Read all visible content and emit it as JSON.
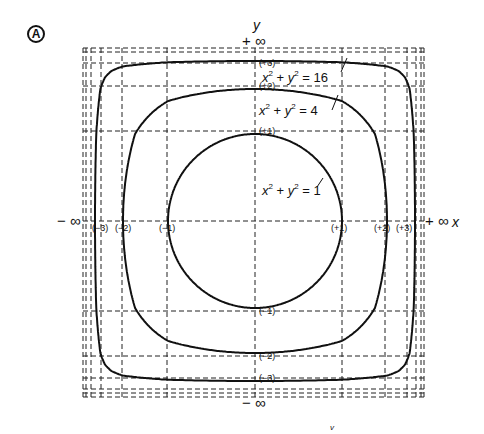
{
  "figure": {
    "panel_label": "A",
    "x_axis_label": "x",
    "y_axis_label": "y",
    "pos_inf_x": "+ ∞",
    "neg_inf_x": "− ∞",
    "pos_inf_y": "+ ∞",
    "neg_inf_y": "− ∞",
    "stray_mark": "v"
  },
  "ticks": {
    "x": [
      {
        "value": -3,
        "label": "(−3)",
        "px": 101
      },
      {
        "value": -2,
        "label": "(−2)",
        "px": 122
      },
      {
        "value": -1,
        "label": "(−1)",
        "px": 167
      },
      {
        "value": 1,
        "label": "(+1)",
        "px": 342
      },
      {
        "value": 2,
        "label": "(+2)",
        "px": 385
      },
      {
        "value": 3,
        "label": "(+3)",
        "px": 407
      }
    ],
    "y": [
      {
        "value": 3,
        "label": "(+3)",
        "px": 63
      },
      {
        "value": 2,
        "label": "(+2)",
        "px": 86
      },
      {
        "value": 1,
        "label": "(+1)",
        "px": 131
      },
      {
        "value": -1,
        "label": "(−1)",
        "px": 311
      },
      {
        "value": -2,
        "label": "(−2)",
        "px": 356
      },
      {
        "value": -3,
        "label": "(−3)",
        "px": 378
      }
    ]
  },
  "curves": [
    {
      "equation": "x² + y² = 1",
      "lhs_x": "x",
      "lhs_y": "y",
      "exp": "2",
      "rhs": "1",
      "radius": 1
    },
    {
      "equation": "x² + y² = 4",
      "lhs_x": "x",
      "lhs_y": "y",
      "exp": "2",
      "rhs": "4",
      "radius": 2
    },
    {
      "equation": "x² + y² = 16",
      "lhs_x": "x",
      "lhs_y": "y",
      "exp": "2",
      "rhs": "16",
      "radius": 4
    }
  ],
  "chart_data": {
    "type": "line",
    "xlabel": "x",
    "ylabel": "y",
    "x_range": [
      "−∞",
      "+∞"
    ],
    "y_range": [
      "−∞",
      "+∞"
    ],
    "grid": "dashed, at integer values and approaching ±∞",
    "tick_labels_x": [
      "(−3)",
      "(−2)",
      "(−1)",
      "(+1)",
      "(+2)",
      "(+3)"
    ],
    "tick_labels_y": [
      "(+3)",
      "(+2)",
      "(+1)",
      "(−1)",
      "(−2)",
      "(−3)"
    ],
    "series": [
      {
        "name": "x² + y² = 1",
        "radius": 1
      },
      {
        "name": "x² + y² = 4",
        "radius": 2
      },
      {
        "name": "x² + y² = 16",
        "radius": 4
      }
    ],
    "annotations": [
      "Ⓐ",
      "+ ∞",
      "− ∞",
      "x",
      "y"
    ]
  }
}
